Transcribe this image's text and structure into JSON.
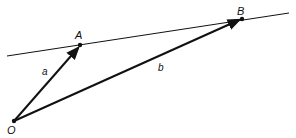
{
  "diagram": {
    "points": {
      "O": {
        "label": "O",
        "x": 14,
        "y": 121
      },
      "A": {
        "label": "A",
        "x": 80,
        "y": 45
      },
      "B": {
        "label": "B",
        "x": 242,
        "y": 19
      }
    },
    "vectors": [
      {
        "name": "a",
        "label": "a",
        "from": "O",
        "to": "A"
      },
      {
        "name": "b",
        "label": "b",
        "from": "O",
        "to": "B"
      }
    ],
    "line": {
      "through": [
        "A",
        "B"
      ]
    },
    "colors": {
      "stroke": "#111111",
      "background": "#ffffff"
    }
  }
}
